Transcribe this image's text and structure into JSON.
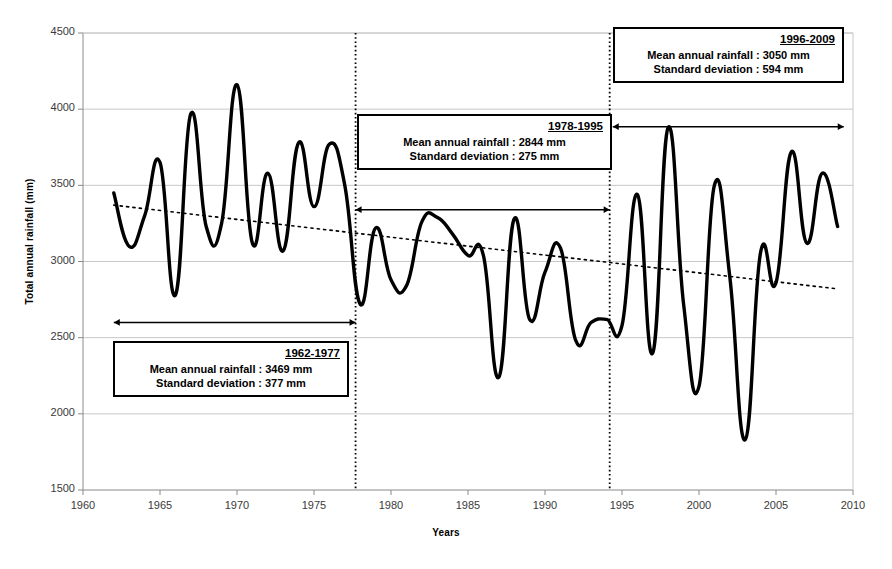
{
  "chart_data": {
    "type": "line",
    "title": "",
    "xlabel": "Years",
    "ylabel": "Total annual rainfall (mm)",
    "xlim": [
      1960,
      2010
    ],
    "ylim": [
      1500,
      4500
    ],
    "xticks": [
      1960,
      1965,
      1970,
      1975,
      1980,
      1985,
      1990,
      1995,
      2000,
      2005,
      2010
    ],
    "yticks": [
      1500,
      2000,
      2500,
      3000,
      3500,
      4000,
      4500
    ],
    "grid": "horizontal",
    "legend": "none",
    "series": [
      {
        "name": "Total annual rainfall",
        "style": "solid-thick-black-smoothed",
        "x": [
          1962,
          1963,
          1964,
          1965,
          1966,
          1967,
          1968,
          1969,
          1970,
          1971,
          1972,
          1973,
          1974,
          1975,
          1976,
          1977,
          1978,
          1979,
          1980,
          1981,
          1982,
          1983,
          1984,
          1985,
          1986,
          1987,
          1988,
          1989,
          1990,
          1991,
          1992,
          1993,
          1994,
          1995,
          1996,
          1997,
          1998,
          1999,
          2000,
          2001,
          2002,
          2003,
          2004,
          2005,
          2006,
          2007,
          2008,
          2009
        ],
        "values": [
          3450,
          3100,
          3300,
          3650,
          2780,
          3970,
          3230,
          3250,
          4160,
          3120,
          3580,
          3070,
          3780,
          3360,
          3770,
          3500,
          2720,
          3220,
          2880,
          2840,
          3260,
          3290,
          3180,
          3040,
          3040,
          2240,
          3280,
          2620,
          2930,
          3090,
          2480,
          2600,
          2620,
          2580,
          3440,
          2400,
          3880,
          2720,
          2180,
          3500,
          2900,
          1830,
          3060,
          2860,
          3720,
          3120,
          3580,
          3230
        ]
      },
      {
        "name": "Linear trend",
        "style": "dotted-thin-black",
        "x": [
          1962,
          2009
        ],
        "values": [
          3370,
          2820
        ]
      }
    ],
    "dividers": [
      {
        "label": "divider-1977-1978",
        "x": 1977.7
      },
      {
        "label": "divider-1995-1996",
        "x": 1994.2
      }
    ],
    "period_markers": [
      {
        "name": "range-arrow-1962-1977",
        "x0": 1962,
        "x1": 1977.7,
        "y": 2600
      },
      {
        "name": "range-arrow-1978-1995",
        "x0": 1977.7,
        "x1": 1994.2,
        "y": 3340
      },
      {
        "name": "range-arrow-1996-2009",
        "x0": 1994.4,
        "x1": 2009.4,
        "y": 3885
      }
    ]
  },
  "annotations": {
    "period_1": {
      "title": "1962-1977",
      "mean_line": "Mean annual rainfall : 3469 mm",
      "sd_line": "Standard deviation : 377 mm"
    },
    "period_2": {
      "title": "1978-1995",
      "mean_line": "Mean annual rainfall : 2844 mm",
      "sd_line": "Standard deviation : 275 mm"
    },
    "period_3": {
      "title": "1996-2009",
      "mean_line": "Mean annual rainfall : 3050 mm",
      "sd_line": "Standard deviation : 594 mm"
    }
  },
  "axes": {
    "y_title": "Total annual rainfall (mm)",
    "x_title": "Years",
    "y_ticks": [
      "1500",
      "2000",
      "2500",
      "3000",
      "3500",
      "4000",
      "4500"
    ],
    "x_ticks": [
      "1960",
      "1965",
      "1970",
      "1975",
      "1980",
      "1985",
      "1990",
      "1995",
      "2000",
      "2005",
      "2010"
    ]
  },
  "colors": {
    "series": "#000000",
    "trend": "#000000",
    "grid": "#c8c8c8",
    "axis": "#8a8a8a",
    "background": "#ffffff"
  }
}
